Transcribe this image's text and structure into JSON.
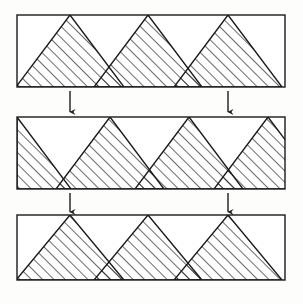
{
  "figure": {
    "background_color": "#fdfdfc",
    "stroke_color": "#1a1a1a",
    "fill_color": "#ffffff",
    "hatch_color": "#1a1a1a",
    "hatch_angle_degrees": 45,
    "hatch_spacing_px": 8,
    "stroke_width_px": 1.4,
    "canvas": {
      "width": 303,
      "height": 304
    }
  },
  "panels": [
    {
      "id": "panel-top",
      "label": "Top strip",
      "rect": {
        "x": 17,
        "y": 15,
        "width": 268,
        "height": 72
      },
      "apex_positions": [
        70,
        148,
        228
      ],
      "half_triangle_left": false,
      "half_triangle_right": true,
      "triangle_half_width": 54,
      "shapes": [
        {
          "type": "triangle",
          "apex_x": 70,
          "hatched": true
        },
        {
          "type": "triangle",
          "apex_x": 148,
          "hatched": true
        },
        {
          "type": "triangle",
          "apex_x": 228,
          "hatched": true
        }
      ]
    },
    {
      "id": "panel-middle",
      "label": "Middle strip",
      "rect": {
        "x": 17,
        "y": 117,
        "width": 268,
        "height": 72
      },
      "apex_positions": [
        110,
        189,
        268
      ],
      "half_triangle_left": true,
      "half_triangle_right": true,
      "triangle_half_width": 54,
      "shapes": [
        {
          "type": "half-triangle-left",
          "apex_x": 17,
          "hatched": true
        },
        {
          "type": "triangle",
          "apex_x": 110,
          "hatched": true
        },
        {
          "type": "triangle",
          "apex_x": 189,
          "hatched": true
        },
        {
          "type": "triangle",
          "apex_x": 268,
          "hatched": true
        }
      ]
    },
    {
      "id": "panel-bottom",
      "label": "Bottom strip",
      "rect": {
        "x": 17,
        "y": 215,
        "width": 268,
        "height": 65
      },
      "apex_positions": [
        70,
        148,
        228
      ],
      "half_triangle_left": false,
      "half_triangle_right": true,
      "triangle_half_width": 54,
      "shapes": [
        {
          "type": "triangle",
          "apex_x": 70,
          "hatched": true
        },
        {
          "type": "triangle",
          "apex_x": 148,
          "hatched": true
        },
        {
          "type": "triangle",
          "apex_x": 228,
          "hatched": true
        }
      ]
    }
  ],
  "arrows": [
    {
      "id": "arrow-top-left",
      "label": "shift arrow 1",
      "x": 70,
      "y_start": 91,
      "y_end": 112,
      "direction": "down"
    },
    {
      "id": "arrow-top-right",
      "label": "shift arrow 2",
      "x": 228,
      "y_start": 91,
      "y_end": 112,
      "direction": "down"
    },
    {
      "id": "arrow-middle-left",
      "label": "shift arrow 3",
      "x": 70,
      "y_start": 193,
      "y_end": 212,
      "direction": "down"
    },
    {
      "id": "arrow-middle-right",
      "label": "shift arrow 4",
      "x": 228,
      "y_start": 193,
      "y_end": 212,
      "direction": "down"
    }
  ]
}
